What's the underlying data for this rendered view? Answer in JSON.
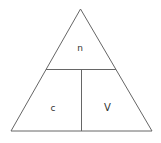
{
  "diagram": {
    "type": "formula-triangle",
    "top_label": "n",
    "bottom_left_label": "c",
    "bottom_right_label": "V",
    "line_color": "#666666",
    "text_color": "#333333",
    "background": "#ffffff"
  }
}
